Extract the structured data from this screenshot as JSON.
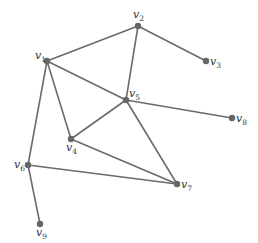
{
  "diagram": {
    "type": "undirected-graph",
    "vertices": [
      {
        "id": "v1",
        "name": "v",
        "sub": "1"
      },
      {
        "id": "v2",
        "name": "v",
        "sub": "2"
      },
      {
        "id": "v3",
        "name": "v",
        "sub": "3"
      },
      {
        "id": "v4",
        "name": "v",
        "sub": "4"
      },
      {
        "id": "v5",
        "name": "v",
        "sub": "5"
      },
      {
        "id": "v6",
        "name": "v",
        "sub": "6"
      },
      {
        "id": "v7",
        "name": "v",
        "sub": "7"
      },
      {
        "id": "v8",
        "name": "v",
        "sub": "8"
      },
      {
        "id": "v9",
        "name": "v",
        "sub": "9"
      }
    ],
    "edges": [
      [
        "v1",
        "v2"
      ],
      [
        "v2",
        "v3"
      ],
      [
        "v2",
        "v5"
      ],
      [
        "v1",
        "v5"
      ],
      [
        "v1",
        "v4"
      ],
      [
        "v1",
        "v6"
      ],
      [
        "v4",
        "v5"
      ],
      [
        "v4",
        "v7"
      ],
      [
        "v5",
        "v7"
      ],
      [
        "v5",
        "v8"
      ],
      [
        "v6",
        "v7"
      ],
      [
        "v6",
        "v9"
      ]
    ],
    "colors": {
      "edge": "#6b6b6b",
      "node": "#666666",
      "label": "#333333"
    }
  }
}
